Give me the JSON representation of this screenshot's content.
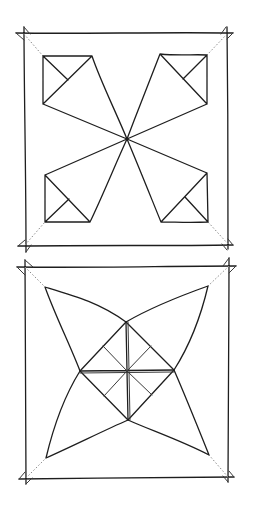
{
  "figure": {
    "title": "",
    "background": "#ffffff",
    "ink_color": "#1e1e1e",
    "dotted_color": "#8a8a8a",
    "panels": [
      {
        "name": "crease-pattern-top",
        "description": "Square with four corner kites meeting at center; dotted diagonals from outer corners to kite corners",
        "outer_square": [
          [
            23,
            33
          ],
          [
            227,
            33
          ],
          [
            228,
            245
          ],
          [
            25,
            246
          ]
        ],
        "center": [
          127,
          139
        ],
        "kites": [
          {
            "corner": "top-left",
            "square": [
              [
                43,
                56
              ],
              [
                92,
                56
              ],
              [
                43,
                104
              ]
            ],
            "inner_fold": [
              68,
              80
            ]
          },
          {
            "corner": "top-right",
            "square": [
              [
                160,
                54
              ],
              [
                207,
                55
              ],
              [
                207,
                104
              ]
            ],
            "inner_fold": [
              183,
              79
            ]
          },
          {
            "corner": "bottom-left",
            "square": [
              [
                45,
                175
              ],
              [
                45,
                222
              ],
              [
                90,
                222
              ]
            ],
            "inner_fold": [
              69,
              199
            ]
          },
          {
            "corner": "bottom-right",
            "square": [
              [
                161,
                222
              ],
              [
                208,
                222
              ],
              [
                207,
                173
              ]
            ],
            "inner_fold": [
              185,
              197
            ]
          }
        ]
      },
      {
        "name": "crease-pattern-bottom",
        "description": "Square with four-pointed star and inner diamond divided by cross and folded quarters",
        "outer_square": [
          [
            23,
            267
          ],
          [
            230,
            266
          ],
          [
            228,
            479
          ],
          [
            25,
            479
          ]
        ],
        "star_points": [
          [
            45,
            287
          ],
          [
            208,
            286
          ],
          [
            209,
            455
          ],
          [
            46,
            458
          ]
        ],
        "diamond": {
          "top": [
            126,
            322
          ],
          "right": [
            174,
            370
          ],
          "bottom": [
            128,
            420
          ],
          "left": [
            80,
            371
          ],
          "center": [
            127,
            371
          ]
        }
      }
    ]
  }
}
